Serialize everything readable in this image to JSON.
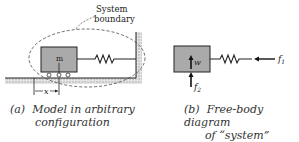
{
  "panel_a": {
    "system_label_line1": "System",
    "system_label_line2": "boundary",
    "mass_label": "m",
    "displacement_label": "x",
    "caption_tag": "(a)",
    "caption_line1": "Model in arbitrary",
    "caption_line2": "configuration"
  },
  "panel_b": {
    "weight_label": "w",
    "force1_label": "f",
    "force1_sub": "1",
    "force2_label": "f",
    "force2_sub": "2",
    "caption_tag": "(b)",
    "caption_line1": "Free-body diagram",
    "caption_line2": "of “system”"
  },
  "colors": {
    "mass_fill": "#aaaaaa",
    "ground_hatch": "#bbbbbb",
    "stroke": "#222222"
  }
}
